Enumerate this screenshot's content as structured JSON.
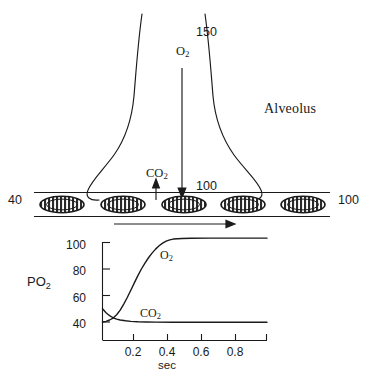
{
  "diagram": {
    "alveolus_label": "Alveolus",
    "alveolar_po2": "150",
    "alveolar_gas_label": "O",
    "alveolar_gas_sub": "2",
    "co2_label": "CO",
    "co2_sub": "2",
    "capillary_end_po2": "100",
    "capillary_inlet_po2": "40",
    "capillary_outlet_po2": "100",
    "red_blood_cell_count": 5,
    "flow_direction": "left-to-right",
    "colors": {
      "ink": "#1a1a1a",
      "background": "#ffffff"
    }
  },
  "chart_data": {
    "type": "line",
    "title": "",
    "xlabel": "sec",
    "ylabel": "PO2",
    "ylabel_main": "PO",
    "ylabel_sub": "2",
    "xlim": [
      0,
      0.93
    ],
    "ylim": [
      30,
      105
    ],
    "grid": false,
    "legend": "inline-annotations",
    "xticks": [
      0.2,
      0.4,
      0.6,
      0.8
    ],
    "xtick_labels": [
      "0.2",
      "0.4",
      "0.6",
      "0.8"
    ],
    "yticks": [
      40,
      60,
      80,
      100
    ],
    "ytick_labels": [
      "40",
      "60",
      "80",
      "100"
    ],
    "series": [
      {
        "name": "O2",
        "label_main": "O",
        "label_sub": "2",
        "x": [
          0.0,
          0.02,
          0.04,
          0.06,
          0.08,
          0.1,
          0.12,
          0.14,
          0.16,
          0.18,
          0.2,
          0.22,
          0.24,
          0.26,
          0.28,
          0.3,
          0.32,
          0.34,
          0.36,
          0.38,
          0.4,
          0.45,
          0.5,
          0.6,
          0.7,
          0.8,
          0.93
        ],
        "values": [
          40,
          40.5,
          41.5,
          43,
          45.5,
          49,
          53.5,
          58.5,
          64,
          69.5,
          75,
          80,
          84.5,
          88.5,
          92,
          95,
          97.5,
          99.5,
          101,
          102,
          102.6,
          103,
          103.2,
          103.3,
          103.3,
          103.3,
          103.3
        ]
      },
      {
        "name": "CO2",
        "label_main": "CO",
        "label_sub": "2",
        "x": [
          0.0,
          0.01,
          0.02,
          0.03,
          0.04,
          0.06,
          0.08,
          0.1,
          0.13,
          0.16,
          0.2,
          0.25,
          0.3,
          0.4,
          0.5,
          0.6,
          0.7,
          0.8,
          0.93
        ],
        "values": [
          50,
          48.5,
          47,
          45.8,
          44.8,
          43.2,
          42.2,
          41.5,
          40.9,
          40.5,
          40.2,
          40.0,
          39.9,
          39.8,
          39.8,
          39.8,
          39.8,
          39.8,
          39.8
        ]
      }
    ]
  }
}
